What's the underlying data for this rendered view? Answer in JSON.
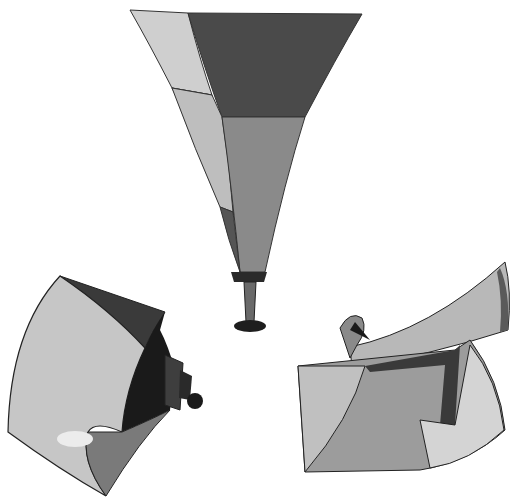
{
  "figure": {
    "title": "Three horn loudspeaker/antenna shapes",
    "horns": [
      {
        "name": "conical-vertical-horn",
        "label": "Vertical flared horn with driver"
      },
      {
        "name": "curved-sectoral-horn-left",
        "label": "Curved sectoral horn with compression driver"
      },
      {
        "name": "radial-horn-right",
        "label": "Radial / sectoral horn with throat"
      }
    ],
    "colors": {
      "background": "#ffffff",
      "light": "#c8c8c8",
      "lighter": "#dcdcdc",
      "mid": "#8a8a8a",
      "midlight": "#a8a8a8",
      "dark": "#4a4a4a",
      "darker": "#2a2a2a",
      "outline": "#222222"
    }
  }
}
